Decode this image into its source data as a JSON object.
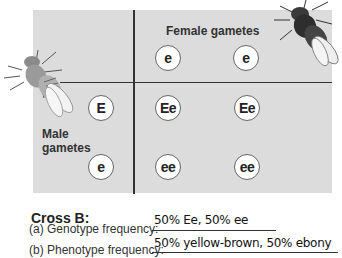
{
  "header": {
    "caption": "Genotype frequency (cut off)"
  },
  "punnett": {
    "female_label": "Female gametes",
    "male_label_line1": "Male",
    "male_label_line2": "gametes",
    "female_gametes": [
      "e",
      "e"
    ],
    "male_gametes": [
      "E",
      "e"
    ],
    "offspring": [
      [
        "Ee",
        "Ee"
      ],
      [
        "ee",
        "ee"
      ]
    ],
    "colors": {
      "background": "#dcdcdc",
      "lines": "#333333",
      "circle_fill": "#ffffff"
    }
  },
  "flies": {
    "left": {
      "icon": "fruit-fly-yellow-brown-icon"
    },
    "right": {
      "icon": "fruit-fly-ebony-icon"
    }
  },
  "cross": {
    "title": "Cross B:",
    "genotype_label": "(a) Genotype frequency:",
    "genotype_answer": "50% Ee, 50% ee",
    "phenotype_label": "(b) Phenotype frequency:",
    "phenotype_answer": "50% yellow-brown, 50% ebony"
  }
}
